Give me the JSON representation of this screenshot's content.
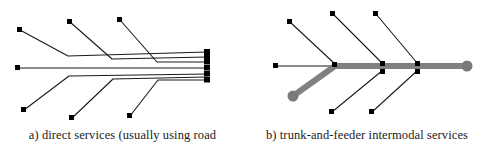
{
  "figure": {
    "width": 489,
    "height": 151,
    "background": "#ffffff"
  },
  "colors": {
    "line_black": "#1a1a1a",
    "node_black": "#000000",
    "trunk_gray": "#808080",
    "terminal_gray": "#7a7a7a",
    "caption_text": "#1a1a1a"
  },
  "panels": [
    {
      "id": "panel-a",
      "caption": "a) direct services (usually using road",
      "diagram": {
        "type": "network-direct-services",
        "description": "Six origin nodes each connected by an individual direct line that bends and runs parallel into a common stack of destination endpoints at the right.",
        "hub_x": 207,
        "hub_nodes_y": [
          52,
          57,
          62,
          68,
          74,
          80
        ],
        "origin_nodes": [
          {
            "name": "upper-left-origin",
            "x": 20,
            "y": 30
          },
          {
            "name": "upper-mid-origin",
            "x": 70,
            "y": 22
          },
          {
            "name": "upper-right-origin",
            "x": 120,
            "y": 20
          },
          {
            "name": "center-left-origin",
            "x": 18,
            "y": 68
          },
          {
            "name": "lower-left-origin",
            "x": 24,
            "y": 110
          },
          {
            "name": "lower-mid-origin",
            "x": 72,
            "y": 118
          },
          {
            "name": "lower-right-origin",
            "x": 130,
            "y": 116
          }
        ],
        "polylines": [
          {
            "name": "route-upper-left",
            "points": "20,30 68,56 207,52"
          },
          {
            "name": "route-upper-mid",
            "points": "70,22 112,59 207,57"
          },
          {
            "name": "route-upper-right",
            "points": "120,20 157,62 207,62"
          },
          {
            "name": "route-center",
            "points": "18,68 207,68"
          },
          {
            "name": "route-lower-left",
            "points": "24,110 69,76 207,74"
          },
          {
            "name": "route-lower-mid",
            "points": "72,118 113,79 207,77"
          },
          {
            "name": "route-lower-right",
            "points": "130,116 158,80 207,80"
          }
        ]
      }
    },
    {
      "id": "panel-b",
      "caption": "b) trunk-and-feeder intermodal services",
      "diagram": {
        "type": "network-trunk-and-feeder",
        "description": "A thick gray trunk line runs from a round gray terminal at lower left up to an apex, then horizontally right to a second round gray terminal; thin black feeder lines branch from junction nodes on the trunk.",
        "trunk": {
          "name": "trunk-line",
          "points": "48,96 90,66 222,66",
          "stroke_width": 6,
          "color": "#808080"
        },
        "terminals": [
          {
            "name": "trunk-terminal-left",
            "x": 48,
            "y": 96,
            "r": 5.5,
            "color": "#7a7a7a"
          },
          {
            "name": "trunk-terminal-right",
            "x": 222,
            "y": 66,
            "r": 5.5,
            "color": "#7a7a7a"
          }
        ],
        "junction_nodes": [
          {
            "name": "junction-1",
            "x": 90,
            "y": 66
          },
          {
            "name": "junction-2",
            "x": 138,
            "y": 66
          },
          {
            "name": "junction-3",
            "x": 173,
            "y": 66
          }
        ],
        "feeder_nodes": [
          {
            "name": "feeder-node-west",
            "x": 31,
            "y": 66
          },
          {
            "name": "feeder-node-upper-1",
            "x": 45,
            "y": 22
          },
          {
            "name": "feeder-node-upper-2",
            "x": 88,
            "y": 14
          },
          {
            "name": "feeder-node-upper-3",
            "x": 131,
            "y": 14
          },
          {
            "name": "feeder-node-lower-1",
            "x": 87,
            "y": 112
          },
          {
            "name": "feeder-node-lower-2",
            "x": 127,
            "y": 112
          }
        ],
        "feeders": [
          {
            "name": "feeder-west",
            "points": "31,66 90,66"
          },
          {
            "name": "feeder-upper-1",
            "points": "45,22 90,64"
          },
          {
            "name": "feeder-upper-2",
            "points": "88,14 138,64"
          },
          {
            "name": "feeder-upper-3",
            "points": "131,14 173,64"
          },
          {
            "name": "feeder-lower-1",
            "points": "87,112 138,70"
          },
          {
            "name": "feeder-lower-2",
            "points": "127,112 173,70"
          }
        ]
      }
    }
  ]
}
